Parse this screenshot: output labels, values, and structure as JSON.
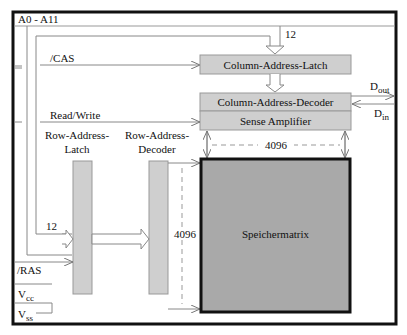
{
  "diagram": {
    "signals": {
      "address": "A0 - A11",
      "cas": "/CAS",
      "read_write": "Read/Write",
      "ras": "/RAS",
      "vcc_main": "V",
      "vcc_sub": "cc",
      "vss_main": "V",
      "vss_sub": "ss",
      "dout_main": "D",
      "dout_sub": "out",
      "din_main": "D",
      "din_sub": "in"
    },
    "bus_widths": {
      "column_address": "12",
      "row_address": "12",
      "columns": "4096",
      "rows": "4096"
    },
    "blocks": {
      "column_address_latch": "Column-Address-Latch",
      "column_address_decoder": "Column-Address-Decoder",
      "sense_amplifier": "Sense Amplifier",
      "row_address_latch_line1": "Row-Address-",
      "row_address_latch_line2": "Latch",
      "row_address_decoder_line1": "Row-Address-",
      "row_address_decoder_line2": "Decoder",
      "memory_matrix": "Speichermatrix"
    },
    "colors": {
      "block_fill": "#cfcfcf",
      "matrix_fill": "#a9a9a9",
      "line": "#777777",
      "border": "#111111"
    }
  }
}
